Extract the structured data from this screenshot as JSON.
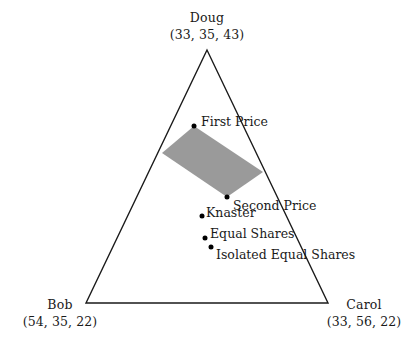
{
  "figure": {
    "type": "simplex-diagram",
    "background_color": "#ffffff",
    "line_color": "#1a1a1a",
    "shaded_region_color": "#9a9a9a",
    "marker_color": "#000000"
  },
  "chart_data": {
    "type": "scatter",
    "title": "",
    "xlabel": "",
    "ylabel": "",
    "grid": false,
    "legend": "none",
    "triangle": {
      "vertices": [
        {
          "name": "Doug",
          "coords": "(33, 35, 43)",
          "x": 207,
          "y": 50
        },
        {
          "name": "Bob",
          "coords": "(54, 35, 22)",
          "x": 86,
          "y": 303
        },
        {
          "name": "Carol",
          "coords": "(33, 56, 22)",
          "x": 328,
          "y": 303
        }
      ]
    },
    "shaded_region": {
      "label": "core region",
      "color": "#9a9a9a",
      "polygon": [
        {
          "x": 194,
          "y": 126
        },
        {
          "x": 263,
          "y": 172
        },
        {
          "x": 227,
          "y": 197
        },
        {
          "x": 162,
          "y": 153
        }
      ]
    },
    "points": [
      {
        "name": "First Price",
        "x": 194,
        "y": 126,
        "label_dx": 7,
        "label_dy": -10
      },
      {
        "name": "Second Price",
        "x": 227,
        "y": 197,
        "label_dx": 6,
        "label_dy": 3
      },
      {
        "name": "Knaster",
        "x": 202,
        "y": 216,
        "label_dx": 4,
        "label_dy": -9
      },
      {
        "name": "Equal Shares",
        "x": 205,
        "y": 238,
        "label_dx": 5,
        "label_dy": -10
      },
      {
        "name": "Isolated Equal Shares",
        "x": 211,
        "y": 247,
        "label_dx": 5,
        "label_dy": 2
      }
    ]
  },
  "labels": {
    "doug_name": "Doug",
    "doug_coords": "(33, 35, 43)",
    "bob_name": "Bob",
    "bob_coords": "(54, 35, 22)",
    "carol_name": "Carol",
    "carol_coords": "(33, 56, 22)",
    "first_price": "First Price",
    "second_price": "Second Price",
    "knaster": "Knaster",
    "equal_shares": "Equal Shares",
    "isolated_equal_shares": "Isolated Equal Shares"
  }
}
